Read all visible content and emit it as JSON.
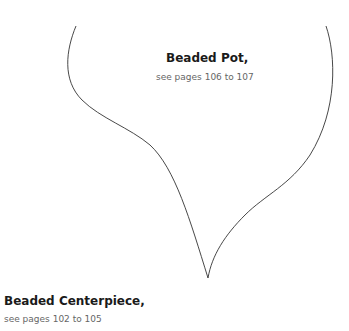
{
  "pattern": {
    "outline_color": "#333333",
    "labels": [
      {
        "title": "Beaded Pot,",
        "subtitle": "see pages 106 to 107"
      },
      {
        "title": "Beaded Centerpiece,",
        "subtitle": "see pages 102 to 105"
      }
    ]
  }
}
